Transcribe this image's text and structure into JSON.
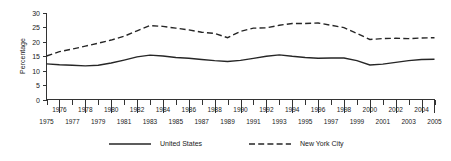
{
  "chart_data": {
    "type": "line",
    "title": "",
    "xlabel": "",
    "ylabel": "Percentage",
    "ylim": [
      0,
      30
    ],
    "yticks": [
      0,
      5,
      10,
      15,
      20,
      25,
      30
    ],
    "xlim": [
      1975,
      2005
    ],
    "grid": false,
    "legend_position": "bottom",
    "x": [
      1975,
      1976,
      1977,
      1978,
      1979,
      1980,
      1981,
      1982,
      1983,
      1984,
      1985,
      1986,
      1987,
      1988,
      1989,
      1990,
      1991,
      1992,
      1993,
      1994,
      1995,
      1996,
      1997,
      1998,
      1999,
      2000,
      2001,
      2002,
      2003,
      2004,
      2005
    ],
    "x_labels_upper": [
      "1976",
      "1978",
      "1980",
      "1982",
      "1984",
      "1986",
      "1988",
      "1990",
      "1992",
      "1994",
      "1996",
      "1998",
      "2000",
      "2002",
      "2004"
    ],
    "x_labels_lower": [
      "1975",
      "1977",
      "1979",
      "1981",
      "1983",
      "1985",
      "1987",
      "1989",
      "1991",
      "1993",
      "1995",
      "1997",
      "1999",
      "2001",
      "2003",
      "2005"
    ],
    "series": [
      {
        "name": "United States",
        "style": "solid",
        "color": "#262626",
        "values": [
          12.3,
          12.0,
          11.8,
          11.6,
          11.8,
          12.6,
          13.6,
          14.7,
          15.3,
          15.0,
          14.5,
          14.2,
          13.8,
          13.4,
          13.1,
          13.5,
          14.2,
          14.9,
          15.4,
          14.9,
          14.5,
          14.2,
          14.3,
          14.3,
          13.4,
          11.9,
          12.2,
          12.8,
          13.4,
          13.8,
          13.9
        ]
      },
      {
        "name": "New York City",
        "style": "dashed",
        "color": "#262626",
        "values": [
          15.0,
          16.5,
          17.4,
          18.4,
          19.4,
          20.5,
          21.8,
          23.7,
          25.5,
          25.2,
          24.6,
          24.0,
          23.2,
          22.8,
          21.3,
          23.5,
          24.6,
          24.7,
          25.6,
          26.2,
          26.2,
          26.4,
          25.6,
          24.8,
          22.8,
          20.7,
          21.0,
          21.1,
          21.0,
          21.2,
          21.3
        ]
      }
    ]
  },
  "legend": {
    "items": [
      {
        "label": "United States",
        "style": "solid"
      },
      {
        "label": "New York City",
        "style": "dashed"
      }
    ]
  }
}
